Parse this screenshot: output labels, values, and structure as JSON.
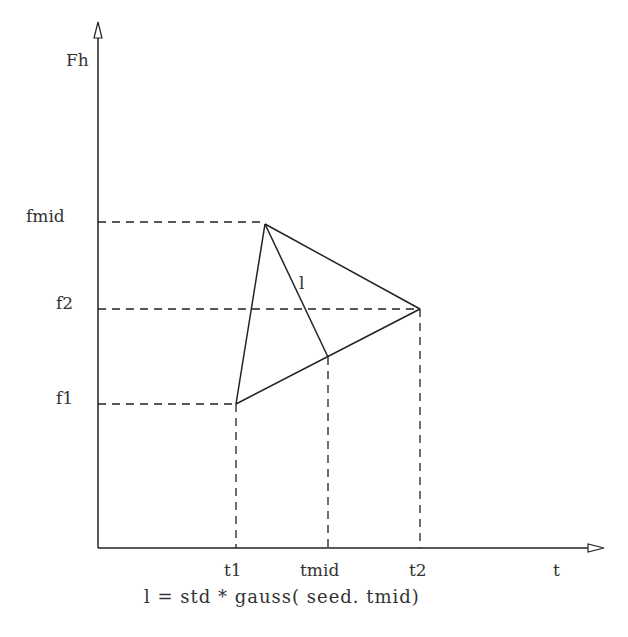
{
  "diagram": {
    "y_axis_label": "Fh",
    "x_axis_label": "t",
    "y_ticks": [
      {
        "label": "fmid",
        "y": 222
      },
      {
        "label": "f2",
        "y": 309
      },
      {
        "label": "f1",
        "y": 404
      }
    ],
    "x_ticks": [
      {
        "label": "t1",
        "x": 236
      },
      {
        "label": "tmid",
        "x": 328
      },
      {
        "label": "t2",
        "x": 420
      }
    ],
    "segment_label": "l",
    "caption": "l = std * gauss( seed. tmid)",
    "colors": {
      "line": "#222222",
      "text": "#333333",
      "background": "#ffffff"
    }
  }
}
